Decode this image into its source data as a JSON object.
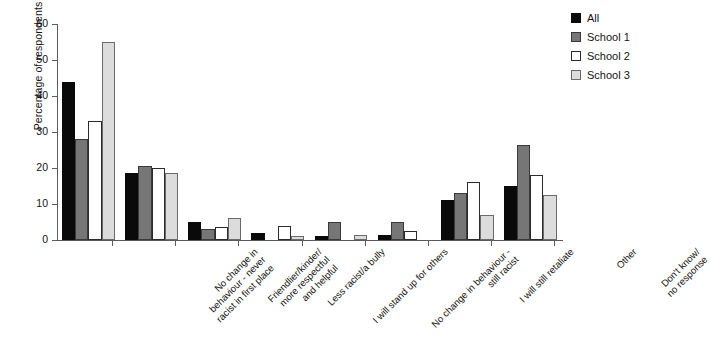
{
  "chart_data": {
    "type": "bar",
    "title": "",
    "xlabel": "",
    "ylabel": "Percentage of respondents",
    "ylim": [
      0,
      60
    ],
    "yticks": [
      0,
      10,
      20,
      30,
      40,
      50,
      60
    ],
    "ytick_labels": [
      "0",
      "10",
      "20",
      "30",
      "40",
      "50",
      "60"
    ],
    "grid": false,
    "legend_position": "top-right",
    "categories": [
      "No change in\nbehaviour - never\nracist in first place",
      "Friendlier/kinder/\nmore respectful\nand helpful",
      "Less racist/a bully",
      "I will stand up for others",
      "No change in behaviour -\nstill racist",
      "I will still retaliate",
      "Other",
      "Don't know/\nno response"
    ],
    "series": [
      {
        "name": "All",
        "color": "#0a0a0a",
        "values": [
          44,
          18.5,
          5,
          2,
          1,
          1.5,
          11,
          15
        ]
      },
      {
        "name": "School 1",
        "color": "#767676",
        "values": [
          28,
          20.5,
          3,
          0,
          5,
          5,
          13,
          26.5
        ]
      },
      {
        "name": "School 2",
        "color": "#ffffff",
        "values": [
          33,
          20,
          3.5,
          4,
          0,
          2.5,
          16,
          18
        ]
      },
      {
        "name": "School 3",
        "color": "#dcdcdc",
        "values": [
          55,
          18.5,
          6,
          1,
          1.5,
          0,
          7,
          12.5
        ]
      }
    ]
  },
  "legend": {
    "items": [
      {
        "label": "All",
        "swatch": "legend-swatch-all"
      },
      {
        "label": "School 1",
        "swatch": "legend-swatch-school-1"
      },
      {
        "label": "School 2",
        "swatch": "legend-swatch-school-2"
      },
      {
        "label": "School 3",
        "swatch": "legend-swatch-school-3"
      }
    ]
  },
  "axes": {
    "y_title": "Percentage of respondents"
  }
}
